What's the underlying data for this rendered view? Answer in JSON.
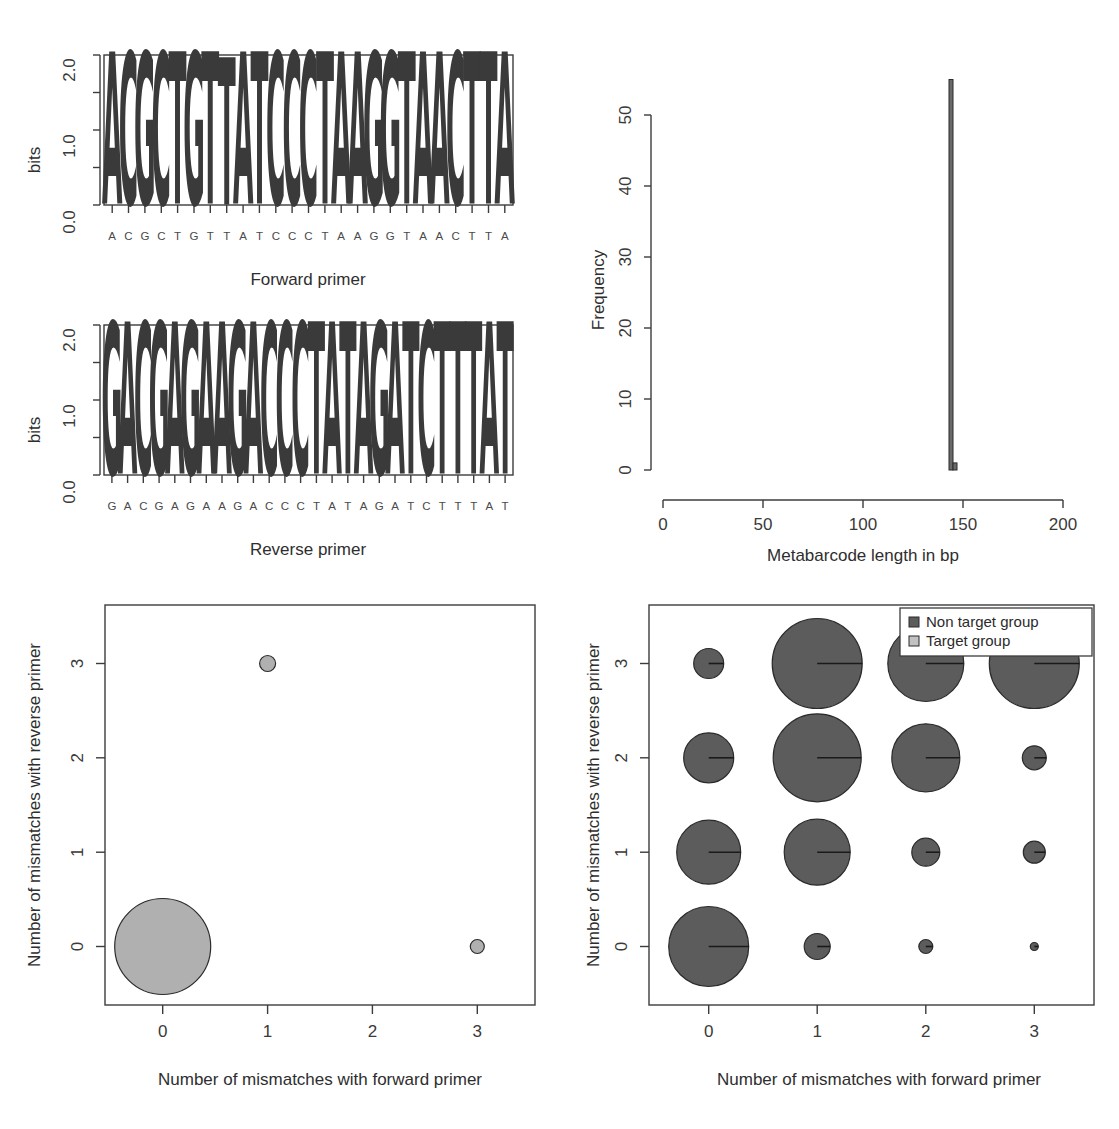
{
  "figure": {
    "panels": [
      "forward-primer-logo",
      "reverse-primer-logo",
      "metabarcode-length-histogram",
      "target-group-mismatch-bubbles",
      "non-target-group-mismatch-bubbles"
    ]
  },
  "chart_data": [
    {
      "id": "forward_primer_logo",
      "type": "bar",
      "title": "Forward primer",
      "xlabel": "",
      "ylabel": "bits",
      "ylim": [
        0,
        2.0
      ],
      "yticks": [
        0.0,
        1.0,
        2.0
      ],
      "ytick_labels": [
        "0.0",
        "1.0",
        "2.0"
      ],
      "sequence": "ACGCTGTTATCCCTAAGGTAACTTA",
      "categories": [
        "A",
        "C",
        "G",
        "C",
        "T",
        "G",
        "T",
        "T",
        "A",
        "T",
        "C",
        "C",
        "C",
        "T",
        "A",
        "A",
        "G",
        "G",
        "T",
        "A",
        "A",
        "C",
        "T",
        "T",
        "A"
      ],
      "values": [
        2.0,
        2.0,
        2.0,
        2.0,
        2.0,
        2.0,
        2.0,
        1.93,
        2.0,
        2.0,
        2.0,
        2.0,
        2.0,
        2.0,
        2.0,
        2.0,
        2.0,
        2.0,
        2.0,
        2.0,
        2.0,
        2.0,
        2.0,
        2.0,
        2.0
      ],
      "grid": false,
      "legend": "none"
    },
    {
      "id": "reverse_primer_logo",
      "type": "bar",
      "title": "Reverse primer",
      "xlabel": "",
      "ylabel": "bits",
      "ylim": [
        0,
        2.0
      ],
      "yticks": [
        0.0,
        1.0,
        2.0
      ],
      "ytick_labels": [
        "0.0",
        "1.0",
        "2.0"
      ],
      "sequence": "GACGAGAAGACCCTATAGATCTTTAT",
      "categories": [
        "G",
        "A",
        "C",
        "G",
        "A",
        "G",
        "A",
        "A",
        "G",
        "A",
        "C",
        "C",
        "C",
        "T",
        "A",
        "T",
        "A",
        "G",
        "A",
        "T",
        "C",
        "T",
        "T",
        "T",
        "A",
        "T"
      ],
      "values": [
        2.0,
        2.0,
        2.0,
        2.0,
        2.0,
        2.0,
        2.0,
        2.0,
        2.0,
        2.0,
        2.0,
        2.0,
        2.0,
        2.0,
        2.0,
        2.0,
        2.0,
        2.0,
        2.0,
        2.0,
        2.0,
        2.0,
        2.0,
        2.0,
        2.0,
        2.0
      ],
      "grid": false,
      "legend": "none"
    },
    {
      "id": "metabarcode_length_histogram",
      "type": "bar",
      "title": "",
      "xlabel": "Metabarcode length in bp",
      "ylabel": "Frequency",
      "xlim": [
        0,
        200
      ],
      "ylim": [
        0,
        55
      ],
      "xticks": [
        0,
        50,
        100,
        150,
        200
      ],
      "xtick_labels": [
        "0",
        "50",
        "100",
        "150",
        "200"
      ],
      "yticks": [
        0,
        10,
        20,
        30,
        40,
        50
      ],
      "ytick_labels": [
        "0",
        "10",
        "20",
        "30",
        "40",
        "50"
      ],
      "bins": [
        {
          "center": 144,
          "width": 2,
          "value": 55
        },
        {
          "center": 146,
          "width": 2,
          "value": 1
        }
      ],
      "grid": false,
      "legend": "none"
    },
    {
      "id": "target_group_mismatches",
      "type": "scatter",
      "title": "",
      "xlabel": "Number of mismatches with forward primer",
      "ylabel": "Number of mismatches with reverse primer",
      "xlim": [
        -0.55,
        3.55
      ],
      "ylim": [
        -0.62,
        3.62
      ],
      "xticks": [
        0,
        1,
        2,
        3
      ],
      "xtick_labels": [
        "0",
        "1",
        "2",
        "3"
      ],
      "yticks": [
        0,
        1,
        2,
        3
      ],
      "ytick_labels": [
        "0",
        "1",
        "2",
        "3"
      ],
      "series": [
        {
          "name": "Target group",
          "color": "#b0b0b0",
          "points": [
            {
              "x": 0,
              "y": 0,
              "r": 48
            },
            {
              "x": 1,
              "y": 3,
              "r": 8
            },
            {
              "x": 3,
              "y": 0,
              "r": 7
            }
          ]
        }
      ],
      "grid": false,
      "legend": "none"
    },
    {
      "id": "non_target_group_mismatches",
      "type": "scatter",
      "title": "",
      "xlabel": "Number of mismatches with forward primer",
      "ylabel": "Number of mismatches with reverse primer",
      "xlim": [
        -0.55,
        3.55
      ],
      "ylim": [
        -0.62,
        3.62
      ],
      "xticks": [
        0,
        1,
        2,
        3
      ],
      "xtick_labels": [
        "0",
        "1",
        "2",
        "3"
      ],
      "yticks": [
        0,
        1,
        2,
        3
      ],
      "ytick_labels": [
        "0",
        "1",
        "2",
        "3"
      ],
      "series": [
        {
          "name": "Non target group",
          "color": "#5c5c5c",
          "points": [
            {
              "x": 0,
              "y": 0,
              "r": 40
            },
            {
              "x": 1,
              "y": 0,
              "r": 13
            },
            {
              "x": 2,
              "y": 0,
              "r": 7
            },
            {
              "x": 3,
              "y": 0,
              "r": 4
            },
            {
              "x": 0,
              "y": 1,
              "r": 32
            },
            {
              "x": 1,
              "y": 1,
              "r": 33
            },
            {
              "x": 2,
              "y": 1,
              "r": 14
            },
            {
              "x": 3,
              "y": 1,
              "r": 11
            },
            {
              "x": 0,
              "y": 2,
              "r": 25
            },
            {
              "x": 1,
              "y": 2,
              "r": 44
            },
            {
              "x": 2,
              "y": 2,
              "r": 34
            },
            {
              "x": 3,
              "y": 2,
              "r": 12
            },
            {
              "x": 0,
              "y": 3,
              "r": 15
            },
            {
              "x": 1,
              "y": 3,
              "r": 45
            },
            {
              "x": 2,
              "y": 3,
              "r": 38
            },
            {
              "x": 3,
              "y": 3,
              "r": 45
            }
          ]
        }
      ],
      "grid": false,
      "legend": "top-right",
      "legend_entries": [
        {
          "label": "Non target group",
          "color": "#5c5c5c"
        },
        {
          "label": "Target group",
          "color": "#b0b0b0"
        }
      ]
    }
  ],
  "labels": {
    "bits": "bits",
    "forward_primer": "Forward primer",
    "reverse_primer": "Reverse primer",
    "frequency": "Frequency",
    "metabarcode_length": "Metabarcode length in bp",
    "mismatch_forward": "Number of mismatches with forward primer",
    "mismatch_reverse": "Number of mismatches with reverse primer",
    "legend_non_target": "Non target group",
    "legend_target": "Target group"
  },
  "colors": {
    "base_A": "#b3b3b3",
    "base_C": "#333333",
    "base_G": "#8a8a8a",
    "base_T": "#6e6e6e",
    "axis": "#3c3c3c",
    "target_group": "#b0b0b0",
    "non_target_group": "#5c5c5c",
    "hist_bar": "#6a6a6a"
  }
}
